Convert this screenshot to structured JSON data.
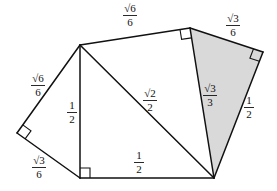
{
  "diagram": {
    "colors": {
      "line": "#111111",
      "shade": "#d9d9d9",
      "background": "#ffffff"
    },
    "vertices": {
      "A": [
        80,
        45
      ],
      "B": [
        190,
        28
      ],
      "C": [
        263,
        52
      ],
      "D": [
        214,
        178
      ],
      "E": [
        80,
        178
      ],
      "F": [
        17,
        133
      ]
    },
    "labels": {
      "AB": {
        "num": "√6",
        "den": "6",
        "x": 130,
        "y": 16
      },
      "BC": {
        "num": "√3",
        "den": "6",
        "x": 233,
        "y": 26
      },
      "BD": {
        "num": "√3",
        "den": "3",
        "x": 209,
        "y": 95
      },
      "CD": {
        "num": "1",
        "den": "2",
        "x": 249,
        "y": 108
      },
      "AD": {
        "num": "√2",
        "den": "2",
        "x": 149,
        "y": 100
      },
      "AE": {
        "num": "1",
        "den": "2",
        "x": 70,
        "y": 113
      },
      "ED": {
        "num": "1",
        "den": "2",
        "x": 139,
        "y": 160
      },
      "AF": {
        "num": "√6",
        "den": "6",
        "x": 38,
        "y": 86
      },
      "FE": {
        "num": "√3",
        "den": "6",
        "x": 38,
        "y": 168
      }
    },
    "right_angles": [
      "B",
      "C",
      "E",
      "F"
    ],
    "shaded_triangle": [
      "B",
      "C",
      "D"
    ]
  }
}
